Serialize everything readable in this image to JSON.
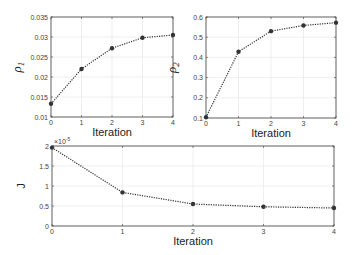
{
  "chart_data": [
    {
      "type": "line",
      "title": "",
      "xlabel": "Iteration",
      "ylabel": "ρ1",
      "x": [
        0,
        1,
        2,
        3,
        4
      ],
      "values": [
        0.0133,
        0.022,
        0.0272,
        0.0298,
        0.0305
      ],
      "xlim": [
        0,
        4
      ],
      "ylim": [
        0.01,
        0.035
      ],
      "xticks": [
        "0",
        "1",
        "2",
        "3",
        "4"
      ],
      "yticks": [
        "0.01",
        "0.015",
        "0.02",
        "0.025",
        "0.03",
        "0.035"
      ],
      "grid": true,
      "line_style": "dotted",
      "marker": "circle"
    },
    {
      "type": "line",
      "title": "",
      "xlabel": "Iteration",
      "ylabel": "ρ2",
      "x": [
        0,
        1,
        2,
        3,
        4
      ],
      "values": [
        0.104,
        0.428,
        0.53,
        0.558,
        0.572
      ],
      "xlim": [
        0,
        4
      ],
      "ylim": [
        0.1,
        0.6
      ],
      "xticks": [
        "0",
        "1",
        "2",
        "3",
        "4"
      ],
      "yticks": [
        "0.1",
        "0.2",
        "0.3",
        "0.4",
        "0.5",
        "0.6"
      ],
      "grid": true,
      "line_style": "dotted",
      "marker": "circle"
    },
    {
      "type": "line",
      "title": "",
      "xlabel": "Iteration",
      "ylabel": "J",
      "x": [
        0,
        1,
        2,
        3,
        4
      ],
      "values": [
        1.96e-05,
        8.4e-06,
        5.5e-06,
        4.8e-06,
        4.5e-06
      ],
      "xlim": [
        0,
        4
      ],
      "ylim": [
        0,
        2e-05
      ],
      "xticks": [
        "0",
        "1",
        "2",
        "3",
        "4"
      ],
      "yticks": [
        "0",
        "0.5",
        "1",
        "1.5",
        "2"
      ],
      "y_multiplier": "×10⁻⁵",
      "grid": true,
      "line_style": "dotted",
      "marker": "circle"
    }
  ],
  "labels": {
    "p1_x": "Iteration",
    "p1_y": "ρ",
    "p1_y_sub": "1",
    "p2_x": "Iteration",
    "p2_y": "ρ",
    "p2_y_sub": "2",
    "p3_x": "Iteration",
    "p3_y": "J",
    "p3_mult": "×10",
    "p3_mult_exp": "-5"
  }
}
